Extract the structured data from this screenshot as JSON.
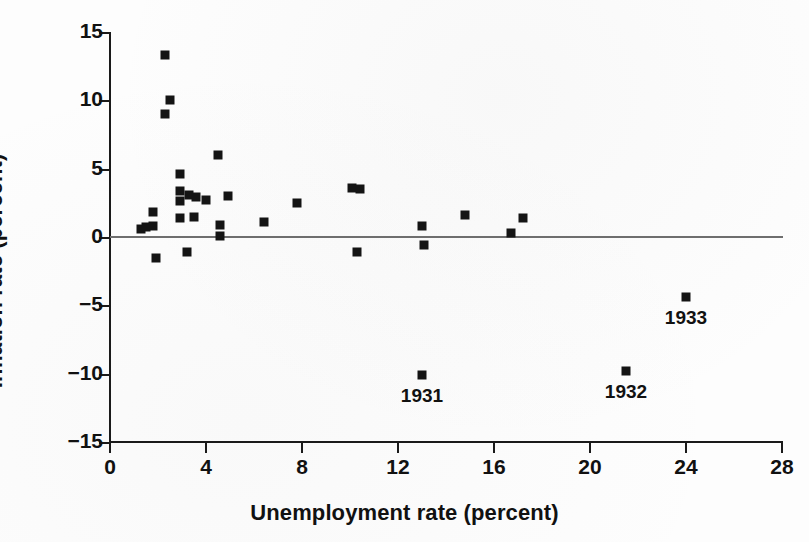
{
  "chart_data": {
    "type": "scatter",
    "title": "",
    "xlabel": "Unemployment rate (percent)",
    "ylabel": "Inflation rate (percent)",
    "xlim": [
      0,
      28
    ],
    "ylim": [
      -15,
      15
    ],
    "xticks": [
      0,
      4,
      8,
      12,
      16,
      20,
      24,
      28
    ],
    "yticks": [
      15,
      10,
      5,
      0,
      -5,
      -10,
      -15
    ],
    "xtick_labels": [
      "0",
      "4",
      "8",
      "12",
      "16",
      "20",
      "24",
      "28"
    ],
    "ytick_labels": [
      "15",
      "10",
      "5",
      "0",
      "−5",
      "−10",
      "−15"
    ],
    "grid": false,
    "legend": null,
    "zero_reference_line": 0,
    "marker": "filled-square",
    "marker_color": "#141414",
    "points": [
      {
        "x": 1.3,
        "y": 0.6,
        "label": null
      },
      {
        "x": 1.5,
        "y": 0.7,
        "label": null
      },
      {
        "x": 1.8,
        "y": 0.8,
        "label": null
      },
      {
        "x": 1.8,
        "y": 1.8,
        "label": null
      },
      {
        "x": 1.9,
        "y": -1.5,
        "label": null
      },
      {
        "x": 2.3,
        "y": 13.3,
        "label": null
      },
      {
        "x": 2.5,
        "y": 10.0,
        "label": null
      },
      {
        "x": 2.3,
        "y": 9.0,
        "label": null
      },
      {
        "x": 2.9,
        "y": 4.6,
        "label": null
      },
      {
        "x": 2.9,
        "y": 3.4,
        "label": null
      },
      {
        "x": 2.9,
        "y": 2.6,
        "label": null
      },
      {
        "x": 2.9,
        "y": 1.4,
        "label": null
      },
      {
        "x": 3.2,
        "y": -1.1,
        "label": null
      },
      {
        "x": 3.3,
        "y": 3.1,
        "label": null
      },
      {
        "x": 3.6,
        "y": 2.9,
        "label": null
      },
      {
        "x": 3.5,
        "y": 1.5,
        "label": null
      },
      {
        "x": 4.0,
        "y": 2.7,
        "label": null
      },
      {
        "x": 4.5,
        "y": 6.0,
        "label": null
      },
      {
        "x": 4.6,
        "y": 0.9,
        "label": null
      },
      {
        "x": 4.6,
        "y": 0.1,
        "label": null
      },
      {
        "x": 4.9,
        "y": 3.0,
        "label": null
      },
      {
        "x": 6.4,
        "y": 1.1,
        "label": null
      },
      {
        "x": 7.8,
        "y": 2.5,
        "label": null
      },
      {
        "x": 10.1,
        "y": 3.6,
        "label": null
      },
      {
        "x": 10.4,
        "y": 3.5,
        "label": null
      },
      {
        "x": 10.3,
        "y": -1.1,
        "label": null
      },
      {
        "x": 13.0,
        "y": 0.8,
        "label": null
      },
      {
        "x": 13.1,
        "y": -0.6,
        "label": null
      },
      {
        "x": 14.8,
        "y": 1.6,
        "label": null
      },
      {
        "x": 16.7,
        "y": 0.3,
        "label": null
      },
      {
        "x": 17.2,
        "y": 1.4,
        "label": null
      },
      {
        "x": 13.0,
        "y": -10.1,
        "label": "1931"
      },
      {
        "x": 21.5,
        "y": -9.8,
        "label": "1932"
      },
      {
        "x": 24.0,
        "y": -4.4,
        "label": "1933"
      }
    ]
  }
}
